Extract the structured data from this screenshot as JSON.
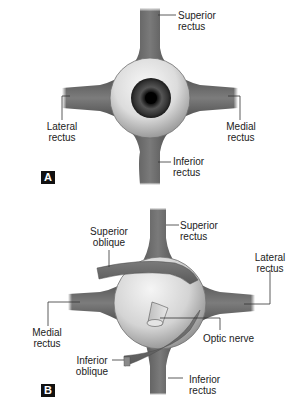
{
  "figure": {
    "panels": [
      {
        "id": "A",
        "badge": "A",
        "view": "anterior eyeball with four recti",
        "labels": {
          "superior_rectus": [
            "Superior",
            "rectus"
          ],
          "lateral_rectus": [
            "Lateral",
            "rectus"
          ],
          "medial_rectus": [
            "Medial",
            "rectus"
          ],
          "inferior_rectus": [
            "Inferior",
            "rectus"
          ]
        }
      },
      {
        "id": "B",
        "badge": "B",
        "view": "posterior eyeball with recti, obliques and optic nerve",
        "labels": {
          "superior_oblique": [
            "Superior",
            "oblique"
          ],
          "superior_rectus": [
            "Superior",
            "rectus"
          ],
          "lateral_rectus": [
            "Lateral",
            "rectus"
          ],
          "medial_rectus": [
            "Medial",
            "rectus"
          ],
          "optic_nerve": [
            "Optic nerve"
          ],
          "inferior_oblique": [
            "Inferior",
            "oblique"
          ],
          "inferior_rectus": [
            "Inferior",
            "rectus"
          ]
        }
      }
    ],
    "colors": {
      "muscle": "#6b6b6b",
      "muscle_dark": "#4a4a4a",
      "globe_light": "#f2f2f2",
      "globe_mid": "#c8c8c8",
      "globe_edge": "#7a7a7a",
      "iris_dark": "#1a1a1a",
      "leader_line": "#333333",
      "badge_bg": "#111111"
    }
  }
}
